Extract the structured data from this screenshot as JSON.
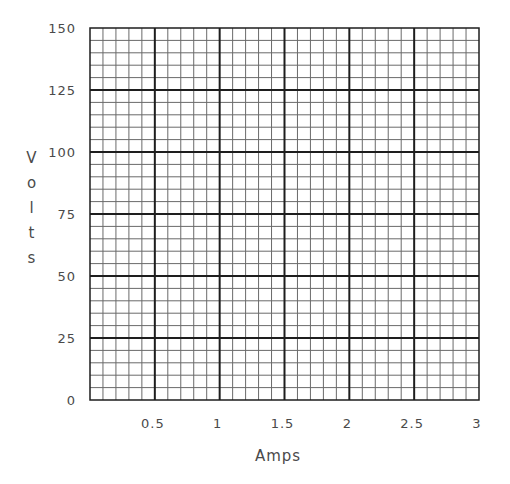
{
  "chart_data": {
    "type": "line",
    "title": "",
    "xlabel": "Amps",
    "ylabel": "Volts",
    "xlim": [
      0,
      3
    ],
    "ylim": [
      0,
      150
    ],
    "x_ticks": [
      0.5,
      1,
      1.5,
      2,
      2.5,
      3
    ],
    "x_tick_labels": [
      "0.5",
      "1",
      "1.5",
      "2",
      "2.5",
      "3"
    ],
    "y_ticks": [
      0,
      25,
      50,
      75,
      100,
      125,
      150
    ],
    "y_tick_labels": [
      "0",
      "25",
      "50",
      "75",
      "100",
      "125",
      "150"
    ],
    "grid": {
      "on": true,
      "major_x_step": 0.5,
      "major_y_step": 25,
      "minor_per_major": 5
    },
    "series": [],
    "legend": null
  },
  "plot": {
    "left": 90,
    "top": 28,
    "right": 479,
    "bottom": 400,
    "major_color": "#1e1e1e",
    "minor_color": "#6a6a6a"
  },
  "labels": {
    "x_axis": "Amps",
    "y_axis_letters": [
      "V",
      "o",
      "l",
      "t",
      "s"
    ]
  }
}
